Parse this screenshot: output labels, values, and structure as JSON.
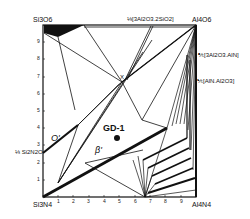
{
  "diagram": {
    "type": "phase-diagram",
    "system": "Si-Al-O-N (Si3N4-Al4N4-Al2O3-Si3O6 square)",
    "corners": {
      "top_left": "Si3O6",
      "top_right": "Al4O6",
      "bottom_left": "Si3N4",
      "bottom_right": "Al4N4"
    },
    "edge_labels": {
      "top": "⅓[3Al2O3.2SiO2]",
      "right_upper": "⅗[3Al2O3.AlN]",
      "right_lower": "⅕[AlN.Al2O3]",
      "left": "⅓ Si2N2O"
    },
    "x_ticks": [
      "1",
      "2",
      "3",
      "4",
      "5",
      "6",
      "7",
      "8",
      "9"
    ],
    "y_ticks": [
      "1",
      "2",
      "3",
      "4",
      "5",
      "6",
      "7",
      "8",
      "9"
    ],
    "phase_labels": {
      "o_prime": "O'",
      "beta_prime": "β'",
      "x_phase": "X",
      "sample": "GD-1"
    },
    "colors": {
      "line": "#111111",
      "background": "#ffffff"
    }
  }
}
